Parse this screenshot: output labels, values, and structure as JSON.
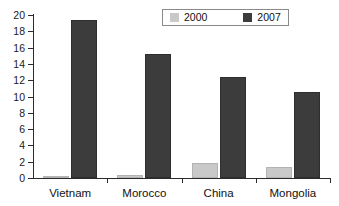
{
  "chart_data": {
    "type": "bar",
    "title": "",
    "subtitle": "",
    "xlabel": "",
    "ylabel": "",
    "categories": [
      "Vietnam",
      "Morocco",
      "China",
      "Mongolia"
    ],
    "series": [
      {
        "name": "2000",
        "color": "#c9c9c9",
        "values": [
          0.1,
          0.35,
          1.9,
          1.4
        ]
      },
      {
        "name": "2007",
        "color": "#3c3c3c",
        "values": [
          19.4,
          15.2,
          12.4,
          10.6
        ]
      }
    ],
    "ylim": [
      0,
      20
    ],
    "yticks": [
      0,
      2,
      4,
      6,
      8,
      10,
      12,
      14,
      16,
      18,
      20
    ],
    "ytick_labels": [
      "0",
      "2",
      "4",
      "6",
      "8",
      "10",
      "12",
      "14",
      "16",
      "18",
      "20"
    ],
    "grid": false,
    "legend_position": "top-right",
    "legend_entries": [
      "2000",
      "2007"
    ]
  },
  "legend": {
    "items": [
      {
        "label": "2000",
        "swatch": "legend-swatch-2000"
      },
      {
        "label": "2007",
        "swatch": "legend-swatch-2007"
      }
    ]
  }
}
